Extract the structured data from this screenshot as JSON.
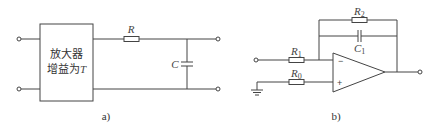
{
  "figure_a": {
    "caption": "a)",
    "amplifier_line1": "放大器",
    "amplifier_line2": "增益为",
    "amplifier_gain_symbol": "T",
    "resistor_label": "R",
    "capacitor_label": "C"
  },
  "figure_b": {
    "caption": "b)",
    "r1_label": "R",
    "r1_sub": "1",
    "r0_label": "R",
    "r0_sub": "0",
    "r2_label": "R",
    "r2_sub": "2",
    "c1_label": "C",
    "c1_sub": "1",
    "inverting_sign": "−",
    "noninverting_sign": "+"
  }
}
